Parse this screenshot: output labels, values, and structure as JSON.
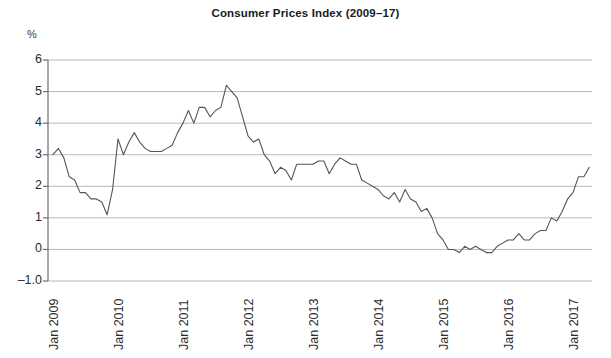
{
  "chart_data": {
    "type": "line",
    "title": "Consumer Prices Index (2009–17)",
    "xlabel": "",
    "ylabel": "%",
    "ylim": [
      -1.0,
      6.0
    ],
    "grid": true,
    "legend": "none",
    "y_ticks": [
      "6",
      "5",
      "4",
      "3",
      "2",
      "1",
      "0",
      "–1.0"
    ],
    "y_tick_values": [
      6,
      5,
      4,
      3,
      2,
      1,
      0,
      -1
    ],
    "x_ticks": [
      "Jan 2009",
      "Jan 2010",
      "Jan 2011",
      "Jan 2012",
      "Jan 2013",
      "Jan 2014",
      "Jan 2015",
      "Jan 2016",
      "Jan 2017"
    ],
    "x_tick_values": [
      2009,
      2010,
      2011,
      2012,
      2013,
      2014,
      2015,
      2016,
      2017
    ],
    "line_color": "#555555",
    "grid_color": "#b8b8b8",
    "axis_color": "#6e6e6e",
    "series": [
      {
        "name": "CPI annual rate",
        "x": [
          2009.0,
          2009.083,
          2009.167,
          2009.25,
          2009.333,
          2009.417,
          2009.5,
          2009.583,
          2009.667,
          2009.75,
          2009.833,
          2009.917,
          2010.0,
          2010.083,
          2010.167,
          2010.25,
          2010.333,
          2010.417,
          2010.5,
          2010.583,
          2010.667,
          2010.75,
          2010.833,
          2010.917,
          2011.0,
          2011.083,
          2011.167,
          2011.25,
          2011.333,
          2011.417,
          2011.5,
          2011.583,
          2011.667,
          2011.75,
          2011.833,
          2011.917,
          2012.0,
          2012.083,
          2012.167,
          2012.25,
          2012.333,
          2012.417,
          2012.5,
          2012.583,
          2012.667,
          2012.75,
          2012.833,
          2012.917,
          2013.0,
          2013.083,
          2013.167,
          2013.25,
          2013.333,
          2013.417,
          2013.5,
          2013.583,
          2013.667,
          2013.75,
          2013.833,
          2013.917,
          2014.0,
          2014.083,
          2014.167,
          2014.25,
          2014.333,
          2014.417,
          2014.5,
          2014.583,
          2014.667,
          2014.75,
          2014.833,
          2014.917,
          2015.0,
          2015.083,
          2015.167,
          2015.25,
          2015.333,
          2015.417,
          2015.5,
          2015.583,
          2015.667,
          2015.75,
          2015.833,
          2015.917,
          2016.0,
          2016.083,
          2016.167,
          2016.25,
          2016.333,
          2016.417,
          2016.5,
          2016.583,
          2016.667,
          2016.75,
          2016.833,
          2016.917,
          2017.0,
          2017.083,
          2017.167,
          2017.25
        ],
        "values": [
          3.0,
          3.2,
          2.9,
          2.3,
          2.2,
          1.8,
          1.8,
          1.6,
          1.6,
          1.5,
          1.1,
          1.9,
          3.5,
          3.0,
          3.4,
          3.7,
          3.4,
          3.2,
          3.1,
          3.1,
          3.1,
          3.2,
          3.3,
          3.7,
          4.0,
          4.4,
          4.0,
          4.5,
          4.5,
          4.2,
          4.4,
          4.5,
          5.2,
          5.0,
          4.8,
          4.2,
          3.6,
          3.4,
          3.5,
          3.0,
          2.8,
          2.4,
          2.6,
          2.5,
          2.2,
          2.7,
          2.7,
          2.7,
          2.7,
          2.8,
          2.8,
          2.4,
          2.7,
          2.9,
          2.8,
          2.7,
          2.7,
          2.2,
          2.1,
          2.0,
          1.9,
          1.7,
          1.6,
          1.8,
          1.5,
          1.9,
          1.6,
          1.5,
          1.2,
          1.3,
          1.0,
          0.5,
          0.3,
          0.0,
          0.0,
          -0.1,
          0.1,
          0.0,
          0.1,
          0.0,
          -0.1,
          -0.1,
          0.1,
          0.2,
          0.3,
          0.3,
          0.5,
          0.3,
          0.3,
          0.5,
          0.6,
          0.6,
          1.0,
          0.9,
          1.2,
          1.6,
          1.8,
          2.3,
          2.3,
          2.6
        ]
      }
    ],
    "annotations": []
  }
}
